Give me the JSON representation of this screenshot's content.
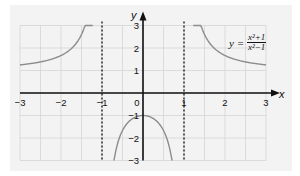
{
  "chart_data": {
    "type": "line",
    "title": "",
    "equation": {
      "lhs": "y =",
      "numerator": "x²+1",
      "denominator": "x²−1"
    },
    "xlabel": "x",
    "ylabel": "y",
    "xlim": [
      -3,
      3
    ],
    "ylim": [
      -3,
      3
    ],
    "x_ticks": [
      "−3",
      "−2",
      "−1",
      "0",
      "1",
      "2",
      "3"
    ],
    "y_ticks": [
      "3",
      "2",
      "1",
      "−1",
      "−2",
      "−3"
    ],
    "grid": true,
    "asymptotes": [
      {
        "type": "vertical",
        "x": -1,
        "style": "dashed"
      },
      {
        "type": "vertical",
        "x": 1,
        "style": "dashed"
      }
    ],
    "series": [
      {
        "name": "y = (x²+1)/(x²−1), x < −1",
        "x": [
          -3,
          -2.5,
          -2,
          -1.75,
          -1.5,
          -1.4,
          -1.3,
          -1.22
        ],
        "y": [
          1.25,
          1.38,
          1.67,
          1.94,
          2.6,
          2.04,
          4.5,
          3.0
        ]
      },
      {
        "name": "y = (x²+1)/(x²−1), −1 < x < 1",
        "x": [
          -0.86,
          -0.75,
          -0.5,
          -0.25,
          0,
          0.25,
          0.5,
          0.75,
          0.86
        ],
        "y": [
          -6.3,
          -3.57,
          -1.67,
          -1.13,
          -1,
          -1.13,
          -1.67,
          -3.57,
          -6.3
        ]
      },
      {
        "name": "y = (x²+1)/(x²−1), x > 1",
        "x": [
          1.22,
          1.3,
          1.5,
          1.75,
          2,
          2.5,
          3
        ],
        "y": [
          3.0,
          4.5,
          2.6,
          1.94,
          1.67,
          1.38,
          1.25
        ]
      }
    ],
    "colors": {
      "curve": "#8c8c8c",
      "axes": "#111111",
      "grid": "#d4d4d4",
      "panel": "#f3f3f3"
    }
  }
}
